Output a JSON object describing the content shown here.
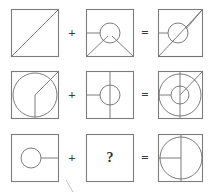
{
  "puzzle": {
    "title": "Figure overlay logic puzzle",
    "operators": {
      "plus": "+",
      "equals": "=",
      "unknown": "?"
    },
    "colors": {
      "background": "#ffffff",
      "frame_stroke": "#7d7d7d",
      "glyph_stroke": "#6e6e6e",
      "text": "#2e2e2e",
      "artifact_stroke": "#b9b9b9"
    },
    "rows": [
      {
        "row_label": "row-1",
        "operand_a": {
          "cell_label": "row-1-operand-a",
          "description": "square with diagonal from bottom-left to top-right"
        },
        "operator_1": "+",
        "operand_b": {
          "cell_label": "row-1-operand-b",
          "description": "square with centered circle, horizontal line from left edge, and two diagonals from bottom corners meeting at circle"
        },
        "operator_2": "=",
        "result": {
          "cell_label": "row-1-result",
          "description": "overlay of diagonal, circle, horizontal line and V diagonals"
        }
      },
      {
        "row_label": "row-2",
        "operand_a": {
          "cell_label": "row-2-operand-a",
          "description": "square with large circle, diagonal from center to top-right corner, vertical line from center downward"
        },
        "operator_1": "+",
        "operand_b": {
          "cell_label": "row-2-operand-b",
          "description": "square with small centered circle, full vertical line, horizontal line from left edge to circle"
        },
        "operator_2": "=",
        "result": {
          "cell_label": "row-2-result",
          "description": "overlay of large circle, small circle, diagonal, vertical line and horizontal line"
        }
      },
      {
        "row_label": "row-3",
        "operand_a": {
          "cell_label": "row-3-operand-a",
          "description": "square with small circle left of center and horizontal line from circle to right edge"
        },
        "operator_1": "+",
        "operand_b": {
          "cell_label": "row-3-operand-b",
          "description": "empty square containing a question mark - the unknown answer"
        },
        "operator_2": "=",
        "result": {
          "cell_label": "row-3-result",
          "description": "large circle with full vertical line and horizontal line from left edge to center"
        }
      }
    ]
  }
}
